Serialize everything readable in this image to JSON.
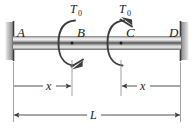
{
  "figure": {
    "type": "engineering-free-body-diagram",
    "colors": {
      "background": "#ffffff",
      "line": "#3c3c3c",
      "label": "#1a1a1a",
      "shaft_light": "#e8e8e8",
      "shaft_mid": "#b5b5b5",
      "shaft_dark": "#6e6e6e",
      "support": "#4a4a4a",
      "hatch": "#9a9a9a"
    },
    "supports": {
      "left": {
        "label": "A",
        "kind": "fixed-wall"
      },
      "right": {
        "label": "D",
        "kind": "fixed-wall"
      }
    },
    "points": [
      {
        "label": "A",
        "role": "fixed-end-left"
      },
      {
        "label": "B",
        "role": "torque-application-point"
      },
      {
        "label": "C",
        "role": "torque-application-point"
      },
      {
        "label": "D",
        "role": "fixed-end-right"
      }
    ],
    "torques": [
      {
        "label": "T",
        "subscript": "0",
        "at": "B",
        "sense": "counterclockwise-arc-arrow-bottom-right"
      },
      {
        "label": "T",
        "subscript": "0",
        "at": "C",
        "sense": "clockwise-arc-arrow-top-right"
      }
    ],
    "dimensions": [
      {
        "label": "x",
        "from": "A",
        "to": "B",
        "style": "inner-arrow"
      },
      {
        "label": "x",
        "from": "D",
        "to": "C",
        "style": "inner-arrow"
      },
      {
        "label": "L",
        "from": "A",
        "to": "D",
        "style": "overall"
      }
    ]
  }
}
